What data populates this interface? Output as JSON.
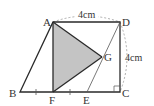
{
  "diagram": {
    "type": "geometry-figure",
    "points": {
      "A": {
        "label": "A",
        "x": 53,
        "y": 22
      },
      "B": {
        "label": "B",
        "x": 20,
        "y": 92
      },
      "C": {
        "label": "C",
        "x": 120,
        "y": 92
      },
      "D": {
        "label": "D",
        "x": 120,
        "y": 22
      },
      "E": {
        "label": "E",
        "x": 87,
        "y": 92
      },
      "F": {
        "label": "F",
        "x": 53,
        "y": 92
      },
      "G": {
        "label": "G",
        "x": 102,
        "y": 57
      }
    },
    "dimensions": {
      "AD": "4cm",
      "DC": "4cm"
    },
    "shaded_region": [
      "A",
      "F",
      "G"
    ],
    "shade_color": "#c4c4c4",
    "line_color": "#2a2a2a"
  }
}
